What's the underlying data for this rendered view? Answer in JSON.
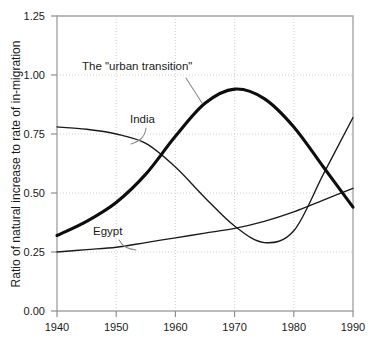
{
  "chart_data": {
    "type": "line",
    "title": "",
    "xlabel": "",
    "ylabel": "Ratio of natural increase to rate of in-migration",
    "xlim": [
      1940,
      1990
    ],
    "ylim": [
      0.0,
      1.25
    ],
    "grid": true,
    "legend_position": "inline-annotations",
    "xticks": [
      "1940",
      "1950",
      "1960",
      "1970",
      "1980",
      "1990"
    ],
    "xtick_values": [
      1940,
      1950,
      1960,
      1970,
      1980,
      1990
    ],
    "yticks": [
      "0.00",
      "0.25",
      "0.50",
      "0.75",
      "1.00",
      "1.25"
    ],
    "ytick_values": [
      0.0,
      0.25,
      0.5,
      0.75,
      1.0,
      1.25
    ],
    "x": [
      1940,
      1945,
      1950,
      1955,
      1960,
      1965,
      1970,
      1975,
      1980,
      1985,
      1990
    ],
    "series": [
      {
        "name": "The \"urban transition\"",
        "style": "thick",
        "values": [
          0.32,
          0.38,
          0.46,
          0.58,
          0.74,
          0.88,
          0.94,
          0.9,
          0.78,
          0.61,
          0.44
        ]
      },
      {
        "name": "India",
        "style": "thin",
        "values": [
          0.78,
          0.77,
          0.75,
          0.71,
          0.61,
          0.48,
          0.36,
          0.29,
          0.34,
          0.58,
          0.82
        ]
      },
      {
        "name": "Egypt",
        "style": "thin",
        "values": [
          0.25,
          0.26,
          0.27,
          0.29,
          0.31,
          0.33,
          0.35,
          0.38,
          0.42,
          0.47,
          0.52
        ]
      }
    ],
    "annotations": [
      {
        "text": "The \"urban transition\"",
        "x_px": 82,
        "y_px": 70
      },
      {
        "text": "India",
        "x_px": 130,
        "y_px": 123
      },
      {
        "text": "Egypt",
        "x_px": 93,
        "y_px": 235
      }
    ]
  }
}
